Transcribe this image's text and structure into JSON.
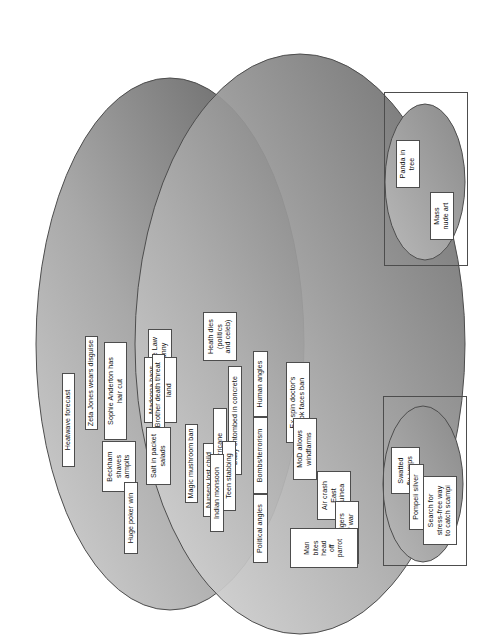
{
  "diagram": {
    "type": "venn",
    "colors": {
      "ellipse_dark": "#6e6e6e",
      "ellipse_light": "#d9d9d9",
      "outline": "#4d4d4d",
      "label_background": "#ffffff",
      "label_text": "#111111",
      "page_background": "#ffffff"
    }
  },
  "main_set": {
    "name": "main-venn",
    "ellipses": [
      {
        "id": "upper-ellipse",
        "name": "upper-news-ellipse"
      },
      {
        "id": "lower-ellipse",
        "name": "lower-news-ellipse"
      }
    ],
    "labels": [
      {
        "id": "beckham",
        "text": "Beckham\nshaves\narmpits"
      },
      {
        "id": "zeta-jones",
        "text": "Zeta Jones wears disguise"
      },
      {
        "id": "sophie",
        "text": "Sophie Anderton has\nhair cut"
      },
      {
        "id": "heatwave",
        "text": "Heatwave forecast"
      },
      {
        "id": "jude-law",
        "text": "Jude Law\nnanny"
      },
      {
        "id": "madonna",
        "text": "Madonna bans\nriding on her\nland"
      },
      {
        "id": "big-brother",
        "text": "Big Brother death threat"
      },
      {
        "id": "salt",
        "text": "Salt in packet\nsalads"
      },
      {
        "id": "magic-mushroom",
        "text": "Magic mushroom ban"
      },
      {
        "id": "nursery",
        "text": "Nursery lost child"
      },
      {
        "id": "huge-poker",
        "text": "Huge poker win"
      },
      {
        "id": "heath-dies",
        "text": "Heath dies\n(politics\nand celeb)"
      },
      {
        "id": "human-angles",
        "text": "Human angles"
      },
      {
        "id": "bombs",
        "text": "Bombs/terrorism"
      },
      {
        "id": "political",
        "text": "Political angles"
      },
      {
        "id": "ex-spin",
        "text": "Ex-spin doctor's\nbook faces ban"
      },
      {
        "id": "mod",
        "text": "MoD allows\nwindfarms"
      },
      {
        "id": "air-crash",
        "text": "Air crash\nEast\nGuinea"
      },
      {
        "id": "tamil",
        "text": "Tamil Tigers\nwarn of war"
      },
      {
        "id": "baby",
        "text": "Baby entombed in concrete"
      },
      {
        "id": "hurricane",
        "text": "Hurricane"
      },
      {
        "id": "teen-stabbing",
        "text": "Teen stabbing"
      },
      {
        "id": "indian-monsoon",
        "text": "Indian monsoon"
      },
      {
        "id": "man-bites",
        "text": "Man\nbites\nhead\noff\nparrot"
      }
    ]
  },
  "satellite_top": {
    "name": "upper-satellite-group",
    "labels": [
      {
        "id": "swatted-fly",
        "text": "Swatted\nfly jumps"
      },
      {
        "id": "pompeii",
        "text": "Pompeii silver"
      },
      {
        "id": "scampi",
        "text": "Search for\nstress-free way\nto catch scampi"
      }
    ]
  },
  "satellite_bottom": {
    "name": "lower-satellite-group",
    "labels": [
      {
        "id": "panda",
        "text": "Panda in\ntree"
      },
      {
        "id": "mass-nude",
        "text": "Mass\nnude art"
      }
    ]
  }
}
